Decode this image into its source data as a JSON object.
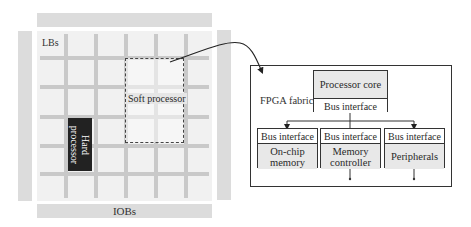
{
  "fpga_chip": {
    "iob_label": "IOBs",
    "lb_label": "LBs",
    "soft_processor_label": "Soft processor",
    "hard_processor_label_lines": [
      "Hard",
      "processor"
    ]
  },
  "detail_panel": {
    "fabric_label": "FPGA fabric",
    "processor_core": {
      "title": "Processor core",
      "bus_label": "Bus interface"
    },
    "peripherals": [
      {
        "bus_label": "Bus interface",
        "name_lines": [
          "On-chip",
          "memory"
        ]
      },
      {
        "bus_label": "Bus interface",
        "name_lines": [
          "Memory",
          "controller"
        ]
      },
      {
        "bus_label": "Bus interface",
        "name_lines": [
          "Peripherals"
        ]
      }
    ]
  },
  "colors": {
    "iob_fill": "#dcdcdc",
    "lb_fill": "#f1f1f1",
    "routing": "#c9c9c9",
    "hard_processor": "#222222",
    "block_shade": "#e8e8e8",
    "stroke": "#333333"
  }
}
